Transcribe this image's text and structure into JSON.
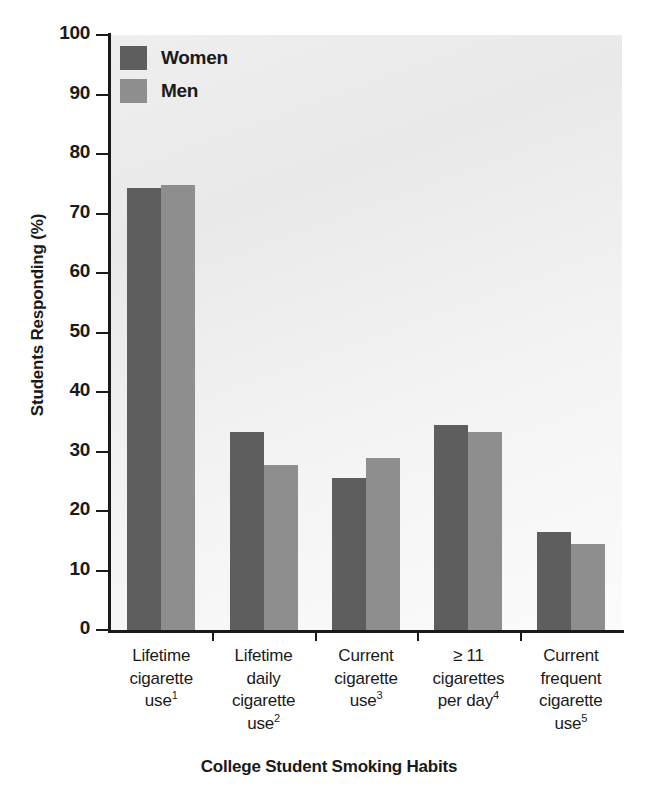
{
  "chart_data": {
    "type": "bar",
    "title": "",
    "xlabel": "College Student Smoking Habits",
    "ylabel": "Students Responding (%)",
    "ylim": [
      0,
      100
    ],
    "ytick_step": 10,
    "yticks": [
      "100",
      "90",
      "80",
      "70",
      "60",
      "50",
      "40",
      "30",
      "20",
      "10",
      "0"
    ],
    "grid": false,
    "legend_position": "top-left",
    "categories": [
      "Lifetime cigarette use",
      "Lifetime daily cigarette use",
      "Current cigarette use",
      "≥ 11 cigarettes per day",
      "Current frequent cigarette use"
    ],
    "category_lines": [
      [
        "Lifetime",
        "cigarette",
        "use"
      ],
      [
        "Lifetime",
        "daily",
        "cigarette",
        "use"
      ],
      [
        "Current",
        "cigarette",
        "use"
      ],
      [
        "≥ 11",
        "cigarettes",
        "per day"
      ],
      [
        "Current",
        "frequent",
        "cigarette",
        "use"
      ]
    ],
    "category_footnotes": [
      "1",
      "2",
      "3",
      "4",
      "5"
    ],
    "series": [
      {
        "name": "Women",
        "color": "#5e5e5e",
        "values": [
          74.3,
          33.3,
          25.5,
          34.5,
          16.5
        ]
      },
      {
        "name": "Men",
        "color": "#8e8e8e",
        "values": [
          74.8,
          27.7,
          28.9,
          33.3,
          14.5
        ]
      }
    ]
  },
  "legend": {
    "women_label": "Women",
    "men_label": "Men"
  },
  "axis": {
    "y_title": "Students Responding (%)",
    "x_title": "College Student Smoking Habits"
  }
}
